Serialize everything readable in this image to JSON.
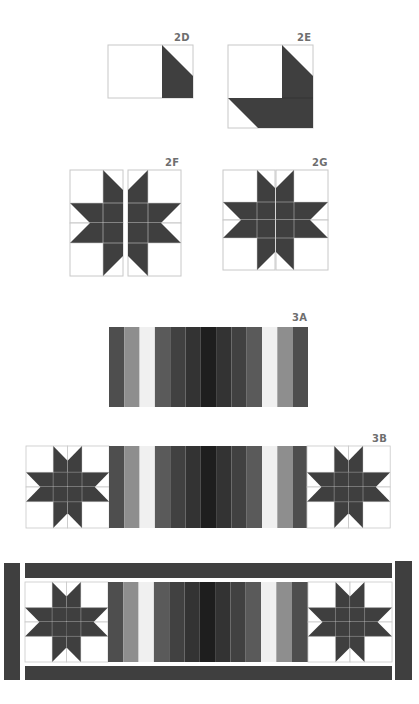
{
  "diagram": {
    "colors": {
      "dark": "#3f3f3f",
      "grid": "#c8c8c8",
      "background": "#ffffff",
      "strips": [
        "#4e4e4e",
        "#8e8e8e",
        "#f0f0f0",
        "#5a5a5a",
        "#414141",
        "#333333",
        "#1e1e1e",
        "#333333",
        "#414141",
        "#5a5a5a",
        "#f0f0f0",
        "#8e8e8e",
        "#4e4e4e"
      ]
    },
    "steps": [
      {
        "id": "2D",
        "label": "2D",
        "description": "Rectangle with dark flying-geese unit at right"
      },
      {
        "id": "2E",
        "label": "2E",
        "description": "Square block with dark L-shaped border units"
      },
      {
        "id": "2F",
        "label": "2F",
        "description": "Four 2E blocks rotated to form star, separated"
      },
      {
        "id": "2G",
        "label": "2G",
        "description": "Four blocks joined into an 8-point star"
      },
      {
        "id": "3A",
        "label": "3A",
        "description": "13 vertical strips in gradient grays"
      },
      {
        "id": "3B",
        "label": "3B",
        "description": "Star blocks sewn to each end of strip panel"
      },
      {
        "id": "final",
        "label": "",
        "description": "Borders added to top, bottom and sides"
      }
    ]
  }
}
